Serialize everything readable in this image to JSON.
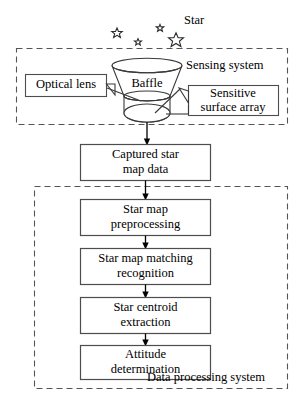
{
  "diagram": {
    "star_label": "Star",
    "stars": [
      {
        "name": "star-small-left",
        "cx": 117,
        "cy": 33,
        "r": 5.0
      },
      {
        "name": "star-tiny-mid",
        "cx": 138,
        "cy": 42,
        "r": 3.4
      },
      {
        "name": "star-tiny-upper",
        "cx": 160,
        "cy": 28,
        "r": 3.6
      },
      {
        "name": "star-large-right",
        "cx": 176,
        "cy": 40,
        "r": 7.2
      }
    ],
    "sensing_system": {
      "label": "Sensing system",
      "baffle_label": "Baffle",
      "callouts": [
        {
          "name": "optical-lens",
          "line1": "Optical lens",
          "line2": ""
        },
        {
          "name": "sensitive-surface-array",
          "line1": "Sensitive",
          "line2": "surface array"
        }
      ]
    },
    "captured_box": {
      "line1": "Captured star",
      "line2": "map data"
    },
    "data_processing_system": {
      "label": "Data processing system",
      "steps": [
        {
          "name": "star-map-preprocessing",
          "line1": "Star map",
          "line2": "preprocessing"
        },
        {
          "name": "star-map-matching-recognition",
          "line1": "Star map matching",
          "line2": "recognition"
        },
        {
          "name": "star-centroid-extraction",
          "line1": "Star centroid",
          "line2": "extraction"
        },
        {
          "name": "attitude-determination",
          "line1": "Attitude",
          "line2": "determination"
        }
      ]
    },
    "colors": {
      "box_stroke": "#4d4d4d",
      "dash_stroke": "#555555",
      "shape_stroke": "#3a3a3a",
      "text": "#000000",
      "background": "#ffffff"
    }
  }
}
